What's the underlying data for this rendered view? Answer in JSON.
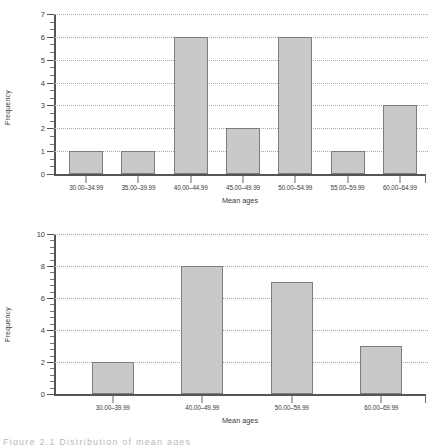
{
  "figure": {
    "caption": "Figure   2.1   Distribution  of   mean ages"
  },
  "chart_data": [
    {
      "id": "top",
      "type": "bar",
      "title": "",
      "xlabel": "Mean ages",
      "ylabel": "Frequency",
      "categories": [
        "30.00–34.99",
        "35.00–39.99",
        "40.00–44.99",
        "45.00–49.99",
        "50.00–54.99",
        "55.00–59.99",
        "60.00–64.99"
      ],
      "values": [
        1,
        1,
        6,
        2,
        6,
        1,
        3
      ],
      "ylim": [
        0,
        7
      ],
      "yticks": [
        0,
        1,
        2,
        3,
        4,
        5,
        6,
        7
      ],
      "ytick_labels": [
        "0",
        "1",
        "2",
        "3",
        "4",
        "5",
        "6",
        "7"
      ],
      "minor_ticks_per_interval": 2,
      "grid": "horizontal-dotted",
      "legend": "none",
      "bar_color": "#c9c9c9",
      "bar_edge_color": "#7d7d7d"
    },
    {
      "id": "bottom",
      "type": "bar",
      "title": "",
      "xlabel": "Mean ages",
      "ylabel": "Frequency",
      "categories": [
        "30.00–39.99",
        "40.00–49.99",
        "50.00–59.99",
        "60.00–69.99"
      ],
      "values": [
        2,
        8,
        7,
        3
      ],
      "ylim": [
        0,
        10
      ],
      "yticks": [
        0,
        2,
        4,
        6,
        8,
        10
      ],
      "ytick_labels": [
        "0",
        "2",
        "4",
        "6",
        "8",
        "10"
      ],
      "minor_ticks_per_interval": 4,
      "grid": "horizontal-dotted",
      "legend": "none",
      "bar_color": "#c9c9c9",
      "bar_edge_color": "#7d7d7d"
    }
  ]
}
